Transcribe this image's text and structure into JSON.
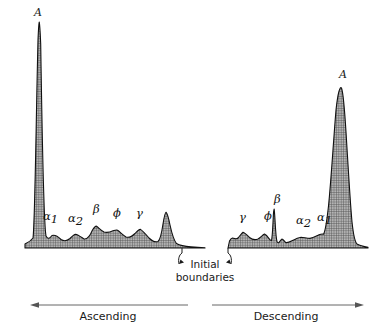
{
  "figure": {
    "background_color": "#ffffff",
    "curve_outline_color": "#101010",
    "curve_fill_color": "#9a9a9a",
    "arrow_color": "#555555",
    "text_color": "#1a1a1a"
  },
  "annotations": {
    "initial_boundaries_line1": "Initial",
    "initial_boundaries_line2": "boundaries",
    "ascending_label": "Ascending",
    "descending_label": "Descending"
  },
  "ascending": {
    "peaks": [
      {
        "name": "albumin-peak",
        "label": "A",
        "sub": "",
        "x": 34,
        "y": 16
      },
      {
        "name": "alpha1-peak",
        "label": "α",
        "sub": "1",
        "x": 43,
        "y": 220
      },
      {
        "name": "alpha2-peak",
        "label": "α",
        "sub": "2",
        "x": 68,
        "y": 222
      },
      {
        "name": "beta-peak",
        "label": "β",
        "sub": "",
        "x": 93,
        "y": 213
      },
      {
        "name": "phi-peak",
        "label": "ϕ",
        "sub": "",
        "x": 113,
        "y": 217
      },
      {
        "name": "gamma-peak",
        "label": "γ",
        "sub": "",
        "x": 136,
        "y": 217
      }
    ]
  },
  "descending": {
    "peaks": [
      {
        "name": "gamma-peak",
        "label": "γ",
        "sub": "",
        "x": 239,
        "y": 221
      },
      {
        "name": "phi-peak",
        "label": "ϕ",
        "sub": "",
        "x": 264,
        "y": 220
      },
      {
        "name": "beta-peak",
        "label": "β",
        "sub": "",
        "x": 274,
        "y": 203
      },
      {
        "name": "alpha2-peak",
        "label": "α",
        "sub": "2",
        "x": 296,
        "y": 224
      },
      {
        "name": "alpha1-peak",
        "label": "α",
        "sub": "1",
        "x": 317,
        "y": 221
      },
      {
        "name": "albumin-peak",
        "label": "A",
        "sub": "",
        "x": 339,
        "y": 78
      }
    ]
  },
  "chart_data": {
    "type": "area",
    "xlabel": "",
    "ylabel": "",
    "grid": false,
    "legend_position": "none",
    "series": [
      {
        "name": "Ascending limb",
        "direction": "Ascending",
        "baseline_y": 248,
        "x_start": 25,
        "x_end": 205,
        "components": [
          {
            "label": "A",
            "kind": "albumin",
            "apex_x": 39,
            "apex_y": 22,
            "relative_height": 1.0
          },
          {
            "label": "α₁",
            "kind": "alpha-1",
            "apex_x": 52,
            "apex_y": 235,
            "relative_height": 0.06
          },
          {
            "label": "α₂",
            "kind": "alpha-2",
            "apex_x": 75,
            "apex_y": 234,
            "relative_height": 0.06
          },
          {
            "label": "β",
            "kind": "beta",
            "apex_x": 96,
            "apex_y": 226,
            "relative_height": 0.1
          },
          {
            "label": "ϕ",
            "kind": "phi",
            "apex_x": 117,
            "apex_y": 230,
            "relative_height": 0.08
          },
          {
            "label": "γ",
            "kind": "gamma",
            "apex_x": 140,
            "apex_y": 229,
            "relative_height": 0.085
          },
          {
            "label": "",
            "kind": "initial-boundary",
            "apex_x": 166,
            "apex_y": 212,
            "relative_height": 0.16
          }
        ]
      },
      {
        "name": "Descending limb",
        "direction": "Descending",
        "baseline_y": 248,
        "x_start": 228,
        "x_end": 368,
        "components": [
          {
            "label": "",
            "kind": "initial-boundary",
            "apex_x": 232,
            "apex_y": 238,
            "relative_height": 0.045
          },
          {
            "label": "γ",
            "kind": "gamma",
            "apex_x": 243,
            "apex_y": 232,
            "relative_height": 0.07
          },
          {
            "label": "ϕ",
            "kind": "phi",
            "apex_x": 265,
            "apex_y": 234,
            "relative_height": 0.06
          },
          {
            "label": "β",
            "kind": "beta",
            "apex_x": 274,
            "apex_y": 209,
            "relative_height": 0.17
          },
          {
            "label": "α₂",
            "kind": "alpha-2",
            "apex_x": 300,
            "apex_y": 237,
            "relative_height": 0.05
          },
          {
            "label": "α₁",
            "kind": "alpha-1",
            "apex_x": 322,
            "apex_y": 234,
            "relative_height": 0.06
          },
          {
            "label": "A",
            "kind": "albumin",
            "apex_x": 342,
            "apex_y": 88,
            "relative_height": 0.71
          }
        ]
      }
    ]
  }
}
